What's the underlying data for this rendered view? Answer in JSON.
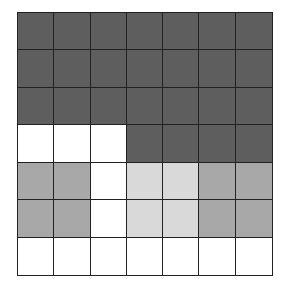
{
  "grid": {
    "rows": 7,
    "cols": 7,
    "palette": {
      "D": "#5e5e5e",
      "M": "#a8a8a8",
      "L": "#d9d9d9",
      "W": "#ffffff"
    },
    "cells": [
      [
        "D",
        "D",
        "D",
        "D",
        "D",
        "D",
        "D"
      ],
      [
        "D",
        "D",
        "D",
        "D",
        "D",
        "D",
        "D"
      ],
      [
        "D",
        "D",
        "D",
        "D",
        "D",
        "D",
        "D"
      ],
      [
        "W",
        "W",
        "W",
        "D",
        "D",
        "D",
        "D"
      ],
      [
        "M",
        "M",
        "W",
        "L",
        "L",
        "M",
        "M"
      ],
      [
        "M",
        "M",
        "W",
        "L",
        "L",
        "M",
        "M"
      ],
      [
        "W",
        "W",
        "W",
        "W",
        "W",
        "W",
        "W"
      ]
    ]
  }
}
